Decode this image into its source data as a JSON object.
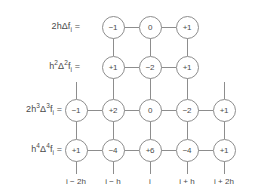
{
  "diagram": {
    "colors": {
      "stroke": "#8d8d8d",
      "text": "#4a4a4a",
      "background": "#ffffff"
    },
    "row_labels": [
      {
        "id": "row-1-label",
        "prefix": "2h",
        "delta": "Δ",
        "delta_sup": "",
        "fn": "f",
        "sub": "i",
        "equals": "=",
        "plain": "2hΔf"
      },
      {
        "id": "row-2-label",
        "prefix": "h",
        "prefix_sup": "2",
        "delta": "Δ",
        "delta_sup": "2",
        "fn": "f",
        "sub": "i",
        "equals": "=",
        "plain": "h²Δ²f"
      },
      {
        "id": "row-3-label",
        "prefix": "2h",
        "prefix_sup": "3",
        "delta": "Δ",
        "delta_sup": "3",
        "fn": "f",
        "sub": "i",
        "equals": "=",
        "plain": "2h³Δ³f"
      },
      {
        "id": "row-4-label",
        "prefix": "h",
        "prefix_sup": "4",
        "delta": "Δ",
        "delta_sup": "4",
        "fn": "f",
        "sub": "i",
        "equals": "=",
        "plain": "h⁴Δ⁴f"
      }
    ],
    "columns": [
      {
        "key": "c1",
        "axis_label": "i − 2h"
      },
      {
        "key": "c2",
        "axis_label": "i − h"
      },
      {
        "key": "c3",
        "axis_label": "i"
      },
      {
        "key": "c4",
        "axis_label": "i + h"
      },
      {
        "key": "c5",
        "axis_label": "i + 2h"
      }
    ],
    "rows": [
      {
        "key": "r1",
        "label_index": 0,
        "nodes": [
          {
            "col": 1,
            "value": "−1"
          },
          {
            "col": 2,
            "value": "0"
          },
          {
            "col": 3,
            "value": "+1"
          }
        ]
      },
      {
        "key": "r2",
        "label_index": 1,
        "nodes": [
          {
            "col": 1,
            "value": "+1"
          },
          {
            "col": 2,
            "value": "−2"
          },
          {
            "col": 3,
            "value": "+1"
          }
        ]
      },
      {
        "key": "r3",
        "label_index": 2,
        "nodes": [
          {
            "col": 0,
            "value": "−1"
          },
          {
            "col": 1,
            "value": "+2"
          },
          {
            "col": 2,
            "value": "0"
          },
          {
            "col": 3,
            "value": "−2"
          },
          {
            "col": 4,
            "value": "+1"
          }
        ]
      },
      {
        "key": "r4",
        "label_index": 3,
        "nodes": [
          {
            "col": 0,
            "value": "+1"
          },
          {
            "col": 1,
            "value": "−4"
          },
          {
            "col": 2,
            "value": "+6"
          },
          {
            "col": 3,
            "value": "−4"
          },
          {
            "col": 4,
            "value": "+1"
          }
        ]
      }
    ],
    "node_values": {
      "r1": {
        "c2": "−1",
        "c3": "0",
        "c4": "+1"
      },
      "r2": {
        "c2": "+1",
        "c3": "−2",
        "c4": "+1"
      },
      "r3": {
        "c1": "−1",
        "c2": "+2",
        "c3": "0",
        "c4": "−2",
        "c5": "+1"
      },
      "r4": {
        "c1": "+1",
        "c2": "−4",
        "c3": "+6",
        "c4": "−4",
        "c5": "+1"
      }
    },
    "equals_sign": "="
  }
}
